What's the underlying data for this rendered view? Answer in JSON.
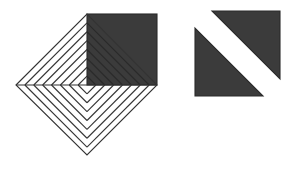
{
  "figure": {
    "title": "Geometric shape comparison",
    "background_color": "#ffffff",
    "canvas": {
      "width": 291,
      "height": 171
    },
    "colors": {
      "fill_dark": "#3b3b3b",
      "stroke_dark": "#2a2a2a",
      "stroke_line": "#333333",
      "fill_white": "#ffffff"
    },
    "stroke_width": 1.1,
    "left_shape": {
      "name": "striped-rotated-square",
      "description": "Square rotated 45 degrees (diamond) with the upper-right quadrant filled dark; all four quadrants carry parallel diagonal stripe lines forming a chevron pattern about the horizontal midline.",
      "vertices": {
        "left": [
          16,
          85
        ],
        "top": [
          87,
          14
        ],
        "right": [
          157,
          85
        ],
        "bottom": [
          87,
          155
        ]
      },
      "center": [
        87,
        85
      ],
      "half_diagonal": 71,
      "dark_quadrant": "upper-right",
      "dark_square_bounds": {
        "x": 87,
        "y": 14,
        "width": 70,
        "height": 71
      },
      "stripe_count_per_quadrant": 7,
      "stripe_spacing": 9
    },
    "right_shape": {
      "name": "split-diagonal-square",
      "description": "Axis-aligned square split by a white diagonal band running from lower-left to upper-right, leaving two dark right triangles.",
      "bounds": {
        "x": 195,
        "y": 11,
        "width": 85,
        "height": 85
      },
      "band_orientation": "lower-left-to-upper-right",
      "band_width": 16,
      "triangles": [
        {
          "name": "upper-right-triangle",
          "points": [
            [
              212,
              11
            ],
            [
              280,
              11
            ],
            [
              280,
              79
            ]
          ]
        },
        {
          "name": "lower-left-triangle",
          "points": [
            [
              195,
              28
            ],
            [
              195,
              96
            ],
            [
              263,
              96
            ]
          ]
        }
      ]
    }
  }
}
